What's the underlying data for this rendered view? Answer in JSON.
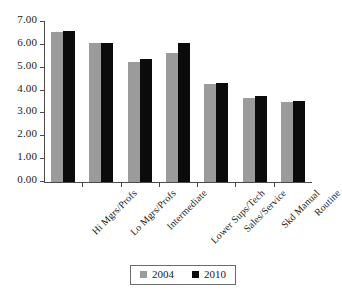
{
  "chart_data": {
    "type": "bar",
    "title": "",
    "subtitle": "",
    "xlabel": "",
    "ylabel": "",
    "ylim": [
      0.0,
      7.0
    ],
    "ytick_step": 1.0,
    "ytick_labels": [
      "0.00",
      "1.00",
      "2.00",
      "3.00",
      "4.00",
      "5.00",
      "6.00",
      "7.00"
    ],
    "ytick_values": [
      0.0,
      1.0,
      2.0,
      3.0,
      4.0,
      5.0,
      6.0,
      7.0
    ],
    "grid": false,
    "legend_position": "bottom-center",
    "categories": [
      "Hi Mgrs/Profs",
      "Lo Mgrs/Profs",
      "Intermediate",
      "Lower Sups/Tech",
      "Sales/Service",
      "Skd Manual",
      "Routine"
    ],
    "series": [
      {
        "name": "2004",
        "color": "#9b9b9b",
        "values": [
          6.57,
          6.08,
          5.24,
          5.65,
          4.3,
          3.67,
          3.52
        ]
      },
      {
        "name": "2010",
        "color": "#0b0b0b",
        "values": [
          6.62,
          6.07,
          5.39,
          6.1,
          4.34,
          3.75,
          3.53
        ]
      }
    ]
  },
  "legend": {
    "entries": [
      {
        "label": "2004",
        "color": "#9b9b9b"
      },
      {
        "label": "2010",
        "color": "#0b0b0b"
      }
    ]
  }
}
